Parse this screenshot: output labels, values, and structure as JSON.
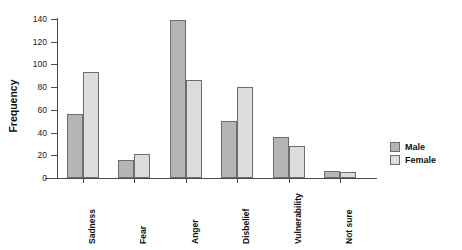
{
  "chart_data": {
    "type": "bar",
    "title": "",
    "xlabel": "",
    "ylabel": "Frequency",
    "categories": [
      "Sadness",
      "Fear",
      "Anger",
      "Disbelief",
      "Vulnerability",
      "Not sure"
    ],
    "series": [
      {
        "name": "Male",
        "values": [
          56,
          16,
          139,
          50,
          36,
          6
        ],
        "color": "#b5b5b5"
      },
      {
        "name": "Female",
        "values": [
          93,
          21,
          86,
          80,
          28,
          5
        ],
        "color": "#dcdcdc"
      }
    ],
    "ylim": [
      0,
      140
    ],
    "yticks": [
      0,
      20,
      40,
      60,
      80,
      100,
      120,
      140
    ],
    "ytick_labels": [
      "0",
      "20",
      "40",
      "60",
      "80",
      "100",
      "120",
      "140"
    ],
    "grid": false,
    "legend_position": "right",
    "legend_entries": [
      "Male",
      "Female"
    ]
  },
  "axis": {
    "y_title": "Frequency",
    "tick_0": "0",
    "tick_20": "20",
    "tick_40": "40",
    "tick_60": "60",
    "tick_80": "80",
    "tick_100": "100",
    "tick_120": "120",
    "tick_140": "140"
  },
  "categories": {
    "c0": "Sadness",
    "c1": "Fear",
    "c2": "Anger",
    "c3": "Disbelief",
    "c4": "Vulnerability",
    "c5": "Not sure"
  },
  "legend": {
    "male": "Male",
    "female": "Female"
  }
}
